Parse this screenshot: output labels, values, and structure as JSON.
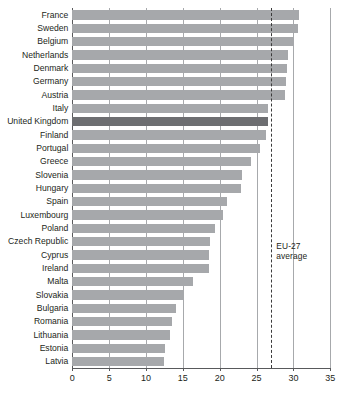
{
  "chart_data": {
    "type": "bar",
    "orientation": "horizontal",
    "title": "",
    "subtitle": "",
    "xlabel": "",
    "ylabel": "",
    "xlim": [
      0,
      35
    ],
    "xticks": [
      0,
      5,
      10,
      15,
      20,
      25,
      30,
      35
    ],
    "xtick_labels": [
      "0",
      "5",
      "10",
      "15",
      "20",
      "25",
      "30",
      "35"
    ],
    "grid": true,
    "grid_axis": "x",
    "legend": false,
    "categories": [
      "France",
      "Sweden",
      "Belgium",
      "Netherlands",
      "Denmark",
      "Germany",
      "Austria",
      "Italy",
      "United Kingdom",
      "Finland",
      "Portugal",
      "Greece",
      "Slovenia",
      "Hungary",
      "Spain",
      "Luxembourg",
      "Poland",
      "Czech Republic",
      "Cyprus",
      "Ireland",
      "Malta",
      "Slovakia",
      "Bulgaria",
      "Romania",
      "Lithuania",
      "Estonia",
      "Latvia"
    ],
    "values": [
      30.7,
      30.6,
      30.1,
      29.3,
      29.1,
      29.0,
      28.9,
      26.6,
      26.5,
      26.3,
      25.4,
      24.3,
      23.0,
      22.9,
      21.0,
      20.4,
      19.4,
      18.7,
      18.5,
      18.5,
      16.4,
      15.2,
      14.1,
      13.5,
      13.2,
      12.6,
      12.4
    ],
    "highlight_category": "United Kingdom",
    "annotations": [
      {
        "name": "eu-27-average",
        "label": "EU-27\naverage",
        "value": 27.0,
        "style": "dashed-vertical-line"
      }
    ],
    "colors": {
      "bar": "#a6a8ab",
      "bar_highlight": "#6d6e71",
      "gridline": "#a7a9ac",
      "axis": "#58595b",
      "reference_line": "#3b3b3b",
      "text": "#231f20",
      "background": "#ffffff"
    }
  }
}
